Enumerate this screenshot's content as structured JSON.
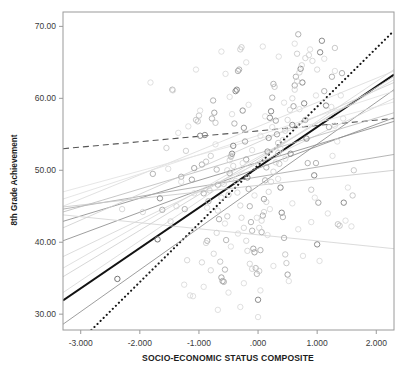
{
  "chart_data": {
    "type": "scatter",
    "title": "",
    "xlabel": "SOCIO-ECONOMIC STATUS COMPOSITE",
    "ylabel": "8th Grade Achievement",
    "xlim": [
      -3.3,
      2.3
    ],
    "ylim": [
      27.8,
      72.0
    ],
    "grid": false,
    "legend": "none",
    "x_ticks": [
      -3.0,
      -2.0,
      -1.0,
      0.0,
      1.0,
      2.0
    ],
    "x_tick_labels": [
      "-3.000",
      "-2.000",
      "-1.000",
      ".000",
      "1.000",
      "2.000"
    ],
    "y_ticks": [
      30.0,
      40.0,
      50.0,
      60.0,
      70.0
    ],
    "y_tick_labels": [
      "30.00",
      "40.00",
      "50.00",
      "60.00",
      "70.00"
    ],
    "marker": "open-circle",
    "marker_size": 5.4,
    "points": [
      [
        -2.38,
        34.9,
        0.55
      ],
      [
        -1.7,
        40.4,
        0.55
      ],
      [
        -1.66,
        46.1,
        0.42
      ],
      [
        -1.78,
        49.5,
        0.3
      ],
      [
        -1.62,
        44.5,
        0.3
      ],
      [
        -1.45,
        61.2,
        0.3
      ],
      [
        -1.55,
        53.1,
        0.22
      ],
      [
        -1.3,
        49.1,
        0.3
      ],
      [
        -1.24,
        44.6,
        0.3
      ],
      [
        -1.22,
        52.7,
        0.22
      ],
      [
        -1.12,
        48.7,
        0.35
      ],
      [
        -1.08,
        50.3,
        0.35
      ],
      [
        -1.05,
        57.0,
        0.25
      ],
      [
        -1.02,
        56.8,
        0.25
      ],
      [
        -1.0,
        57.6,
        0.25
      ],
      [
        -0.98,
        54.8,
        0.45
      ],
      [
        -0.95,
        50.8,
        0.3
      ],
      [
        -0.92,
        46.8,
        0.3
      ],
      [
        -0.9,
        54.9,
        0.45
      ],
      [
        -0.88,
        51.2,
        0.25
      ],
      [
        -0.86,
        40.2,
        0.3
      ],
      [
        -0.84,
        45.7,
        0.3
      ],
      [
        -0.82,
        47.2,
        0.22
      ],
      [
        -0.8,
        52.0,
        0.22
      ],
      [
        -0.78,
        57.2,
        0.3
      ],
      [
        -0.76,
        59.7,
        0.3
      ],
      [
        -0.74,
        58.0,
        0.35
      ],
      [
        -0.72,
        56.6,
        0.25
      ],
      [
        -0.7,
        50.1,
        0.28
      ],
      [
        -0.68,
        48.0,
        0.28
      ],
      [
        -0.66,
        43.2,
        0.3
      ],
      [
        -0.64,
        37.3,
        0.25
      ],
      [
        -0.62,
        35.1,
        0.35
      ],
      [
        -0.6,
        34.6,
        0.35
      ],
      [
        -0.58,
        34.5,
        0.3
      ],
      [
        -0.56,
        36.2,
        0.28
      ],
      [
        -0.54,
        40.3,
        0.28
      ],
      [
        -0.52,
        43.6,
        0.25
      ],
      [
        -0.5,
        46.6,
        0.25
      ],
      [
        -0.48,
        49.6,
        0.3
      ],
      [
        -0.46,
        51.9,
        0.3
      ],
      [
        -0.44,
        52.3,
        0.45
      ],
      [
        -0.42,
        53.4,
        0.45
      ],
      [
        -0.4,
        56.5,
        0.3
      ],
      [
        -0.38,
        61.0,
        0.45
      ],
      [
        -0.36,
        61.2,
        0.45
      ],
      [
        -0.34,
        63.8,
        0.3
      ],
      [
        -0.32,
        64.0,
        0.3
      ],
      [
        -0.3,
        66.8,
        0.22
      ],
      [
        -0.28,
        67.1,
        0.22
      ],
      [
        -0.26,
        58.3,
        0.4
      ],
      [
        -0.24,
        55.9,
        0.4
      ],
      [
        -0.22,
        54.0,
        0.35
      ],
      [
        -0.2,
        51.5,
        0.35
      ],
      [
        -0.18,
        49.0,
        0.45
      ],
      [
        -0.16,
        47.4,
        0.3
      ],
      [
        -0.14,
        45.0,
        0.3
      ],
      [
        -0.12,
        42.8,
        0.28
      ],
      [
        -0.1,
        41.6,
        0.28
      ],
      [
        -0.08,
        39.1,
        0.35
      ],
      [
        -0.06,
        38.6,
        0.35
      ],
      [
        -0.04,
        36.4,
        0.28
      ],
      [
        -0.02,
        35.6,
        0.28
      ],
      [
        0.0,
        32.0,
        0.45
      ],
      [
        0.02,
        36.0,
        0.22
      ],
      [
        0.04,
        38.9,
        0.3
      ],
      [
        0.06,
        41.4,
        0.3
      ],
      [
        0.08,
        43.7,
        0.35
      ],
      [
        0.1,
        46.0,
        0.35
      ],
      [
        0.12,
        48.6,
        0.3
      ],
      [
        0.14,
        50.4,
        0.3
      ],
      [
        0.16,
        52.6,
        0.4
      ],
      [
        0.18,
        54.5,
        0.4
      ],
      [
        0.2,
        57.3,
        0.45
      ],
      [
        0.22,
        58.2,
        0.45
      ],
      [
        0.24,
        60.1,
        0.3
      ],
      [
        0.26,
        62.0,
        0.3
      ],
      [
        0.28,
        61.6,
        0.25
      ],
      [
        0.3,
        56.9,
        0.35
      ],
      [
        0.32,
        55.0,
        0.35
      ],
      [
        0.34,
        53.8,
        0.25
      ],
      [
        0.36,
        50.9,
        0.25
      ],
      [
        0.38,
        47.6,
        0.45
      ],
      [
        0.4,
        44.1,
        0.45
      ],
      [
        0.42,
        43.5,
        0.3
      ],
      [
        0.44,
        40.6,
        0.3
      ],
      [
        0.46,
        38.3,
        0.25
      ],
      [
        0.48,
        37.1,
        0.25
      ],
      [
        0.5,
        35.5,
        0.35
      ],
      [
        0.55,
        52.3,
        0.45
      ],
      [
        0.58,
        56.3,
        0.45
      ],
      [
        0.6,
        58.9,
        0.35
      ],
      [
        0.62,
        61.8,
        0.35
      ],
      [
        0.64,
        63.0,
        0.3
      ],
      [
        0.66,
        66.2,
        0.22
      ],
      [
        0.68,
        68.9,
        0.3
      ],
      [
        0.72,
        64.1,
        0.45
      ],
      [
        0.75,
        62.2,
        0.45
      ],
      [
        0.78,
        59.3,
        0.45
      ],
      [
        0.8,
        57.0,
        0.3
      ],
      [
        0.82,
        54.4,
        0.45
      ],
      [
        0.84,
        51.0,
        0.3
      ],
      [
        0.9,
        47.3,
        0.25
      ],
      [
        0.95,
        49.3,
        0.45
      ],
      [
        0.98,
        51.0,
        0.3
      ],
      [
        1.0,
        39.7,
        0.45
      ],
      [
        1.02,
        45.5,
        0.35
      ],
      [
        1.05,
        66.4,
        0.45
      ],
      [
        1.08,
        68.0,
        0.45
      ],
      [
        1.12,
        61.0,
        0.3
      ],
      [
        1.15,
        59.0,
        0.45
      ],
      [
        1.2,
        56.0,
        0.3
      ],
      [
        1.25,
        63.0,
        0.3
      ],
      [
        1.3,
        67.0,
        0.25
      ],
      [
        1.35,
        42.5,
        0.25
      ],
      [
        1.38,
        42.3,
        0.25
      ],
      [
        1.42,
        63.5,
        0.3
      ],
      [
        1.45,
        45.5,
        0.45
      ],
      [
        1.6,
        46.5,
        0.25
      ],
      [
        1.62,
        50.0,
        0.25
      ],
      [
        -2.3,
        44.6,
        0.18
      ],
      [
        -1.95,
        44.2,
        0.18
      ],
      [
        -1.48,
        42.9,
        0.18
      ],
      [
        -1.38,
        45.0,
        0.18
      ],
      [
        -1.2,
        37.5,
        0.18
      ],
      [
        -1.15,
        32.6,
        0.15
      ],
      [
        -1.1,
        32.5,
        0.15
      ],
      [
        -0.95,
        37.2,
        0.18
      ],
      [
        -0.88,
        39.9,
        0.18
      ],
      [
        -0.8,
        36.1,
        0.18
      ],
      [
        -0.75,
        38.4,
        0.18
      ],
      [
        -0.7,
        41.3,
        0.18
      ],
      [
        -0.68,
        44.4,
        0.18
      ],
      [
        -0.62,
        46.2,
        0.18
      ],
      [
        -0.58,
        48.1,
        0.18
      ],
      [
        -0.52,
        50.0,
        0.18
      ],
      [
        -0.48,
        51.4,
        0.18
      ],
      [
        -0.45,
        52.0,
        0.18
      ],
      [
        -0.42,
        50.6,
        0.18
      ],
      [
        -0.38,
        48.5,
        0.18
      ],
      [
        -0.35,
        46.9,
        0.18
      ],
      [
        -0.3,
        45.1,
        0.18
      ],
      [
        -0.28,
        43.4,
        0.18
      ],
      [
        -0.24,
        42.0,
        0.18
      ],
      [
        -0.2,
        40.2,
        0.18
      ],
      [
        -0.18,
        38.8,
        0.18
      ],
      [
        -0.14,
        37.0,
        0.18
      ],
      [
        -0.1,
        36.3,
        0.18
      ],
      [
        0.02,
        42.0,
        0.18
      ],
      [
        0.06,
        43.0,
        0.18
      ],
      [
        0.1,
        44.2,
        0.18
      ],
      [
        0.14,
        45.6,
        0.18
      ],
      [
        0.18,
        47.0,
        0.18
      ],
      [
        0.22,
        48.4,
        0.18
      ],
      [
        0.26,
        49.8,
        0.18
      ],
      [
        0.3,
        51.1,
        0.18
      ],
      [
        0.34,
        52.4,
        0.18
      ],
      [
        0.38,
        53.0,
        0.18
      ],
      [
        0.42,
        54.2,
        0.18
      ],
      [
        0.46,
        55.5,
        0.18
      ],
      [
        0.5,
        57.0,
        0.18
      ],
      [
        0.54,
        58.4,
        0.18
      ],
      [
        0.58,
        60.0,
        0.18
      ],
      [
        0.62,
        61.2,
        0.18
      ],
      [
        0.66,
        62.4,
        0.18
      ],
      [
        0.7,
        63.6,
        0.18
      ],
      [
        0.74,
        64.6,
        0.18
      ],
      [
        0.8,
        65.6,
        0.18
      ],
      [
        0.86,
        66.0,
        0.18
      ],
      [
        0.92,
        65.2,
        0.18
      ],
      [
        1.0,
        64.0,
        0.18
      ],
      [
        -1.82,
        62.2,
        0.15
      ],
      [
        -1.44,
        61.1,
        0.15
      ],
      [
        -1.05,
        64.0,
        0.15
      ],
      [
        -0.62,
        66.5,
        0.15
      ],
      [
        -0.55,
        63.4,
        0.15
      ],
      [
        -0.48,
        60.2,
        0.15
      ],
      [
        -0.2,
        65.0,
        0.15
      ],
      [
        0.08,
        67.2,
        0.15
      ],
      [
        0.35,
        65.8,
        0.15
      ],
      [
        0.62,
        67.6,
        0.15
      ],
      [
        0.88,
        66.8,
        0.15
      ],
      [
        1.12,
        65.5,
        0.15
      ],
      [
        1.3,
        63.8,
        0.15
      ],
      [
        -1.35,
        55.2,
        0.15
      ],
      [
        -1.18,
        56.1,
        0.15
      ],
      [
        -0.98,
        58.3,
        0.15
      ],
      [
        -0.72,
        53.6,
        0.15
      ],
      [
        -0.44,
        57.8,
        0.15
      ],
      [
        -0.16,
        59.1,
        0.15
      ],
      [
        0.12,
        57.5,
        0.15
      ],
      [
        0.44,
        59.4,
        0.15
      ],
      [
        0.7,
        58.5,
        0.15
      ],
      [
        0.98,
        60.4,
        0.15
      ],
      [
        1.24,
        58.8,
        0.15
      ],
      [
        -1.25,
        34.1,
        0.15
      ],
      [
        -0.92,
        33.8,
        0.15
      ],
      [
        -0.5,
        33.0,
        0.15
      ],
      [
        -0.24,
        34.3,
        0.15
      ],
      [
        0.04,
        33.3,
        0.15
      ],
      [
        0.26,
        36.7,
        0.15
      ],
      [
        0.52,
        34.6,
        0.15
      ],
      [
        0.76,
        38.1,
        0.15
      ],
      [
        1.04,
        37.4,
        0.15
      ],
      [
        -0.3,
        31.0,
        0.15
      ],
      [
        0.0,
        29.6,
        0.15
      ],
      [
        -0.68,
        30.6,
        0.15
      ],
      [
        1.48,
        43.0,
        0.15
      ],
      [
        1.52,
        47.6,
        0.15
      ],
      [
        1.18,
        44.0,
        0.15
      ],
      [
        1.26,
        52.0,
        0.15
      ],
      [
        1.34,
        54.0,
        0.15
      ],
      [
        1.44,
        57.2,
        0.15
      ],
      [
        1.4,
        60.4,
        0.15
      ],
      [
        1.3,
        56.2,
        0.15
      ],
      [
        0.9,
        42.8,
        0.15
      ],
      [
        0.96,
        46.2,
        0.15
      ],
      [
        0.68,
        41.8,
        0.15
      ],
      [
        0.58,
        45.4,
        0.15
      ],
      [
        -0.06,
        46.5,
        0.15
      ],
      [
        0.16,
        41.0,
        0.15
      ],
      [
        -0.46,
        39.4,
        0.15
      ],
      [
        -0.34,
        41.2,
        0.15
      ],
      [
        -0.56,
        42.6,
        0.15
      ],
      [
        -0.86,
        44.8,
        0.15
      ],
      [
        -1.08,
        46.8,
        0.15
      ],
      [
        -1.3,
        48.4,
        0.15
      ],
      [
        -1.52,
        50.2,
        0.15
      ],
      [
        0.04,
        54.8,
        0.15
      ],
      [
        0.24,
        56.0,
        0.15
      ],
      [
        -0.1,
        52.8,
        0.15
      ],
      [
        -0.26,
        51.0,
        0.15
      ],
      [
        0.46,
        51.6,
        0.15
      ],
      [
        0.34,
        48.8,
        0.15
      ],
      [
        0.2,
        44.6,
        0.15
      ],
      [
        -0.02,
        43.4,
        0.15
      ],
      [
        1.58,
        42.2,
        0.15
      ]
    ],
    "lines": [
      {
        "name": "overall-regression",
        "style": "solid-thick",
        "color": "#121212",
        "width": 2.1,
        "x1": -3.3,
        "y1": 31.9,
        "x2": 2.3,
        "y2": 63.3
      },
      {
        "name": "dotted-regression",
        "style": "dotted",
        "color": "#1a1a1a",
        "width": 2.1,
        "x1": -2.82,
        "y1": 27.8,
        "x2": 2.3,
        "y2": 69.4
      },
      {
        "name": "dashed-flat-regression",
        "style": "dashed",
        "color": "#555555",
        "width": 1.1,
        "x1": -3.3,
        "y1": 53.0,
        "x2": 2.3,
        "y2": 57.2
      },
      {
        "name": "group-line-1",
        "style": "solid-thin",
        "color": "#8d8d8d",
        "width": 0.85,
        "x1": -3.3,
        "y1": 28.6,
        "x2": 2.3,
        "y2": 61.2
      },
      {
        "name": "group-line-2",
        "style": "solid-thin",
        "color": "#8d8d8d",
        "width": 0.85,
        "x1": -3.3,
        "y1": 40.2,
        "x2": 2.3,
        "y2": 57.3
      },
      {
        "name": "group-line-3",
        "style": "solid-thin",
        "color": "#8d8d8d",
        "width": 0.85,
        "x1": -3.3,
        "y1": 42.9,
        "x2": 2.3,
        "y2": 56.8
      },
      {
        "name": "group-line-4",
        "style": "solid-thin",
        "color": "#a8a8a8",
        "width": 0.85,
        "x1": -3.3,
        "y1": 44.6,
        "x2": 2.3,
        "y2": 52.2
      },
      {
        "name": "group-line-5",
        "style": "solid-thin",
        "color": "#c9c9c9",
        "width": 0.85,
        "x1": -3.3,
        "y1": 44.9,
        "x2": 2.3,
        "y2": 50.0
      },
      {
        "name": "group-line-6",
        "style": "solid-thin",
        "color": "#d4d4d4",
        "width": 0.85,
        "x1": -3.3,
        "y1": 43.8,
        "x2": 2.3,
        "y2": 39.1
      },
      {
        "name": "group-line-7",
        "style": "solid-thin",
        "color": "#cfcfcf",
        "width": 0.85,
        "x1": -3.3,
        "y1": 35.2,
        "x2": 2.3,
        "y2": 63.0
      },
      {
        "name": "group-line-8",
        "style": "solid-thin",
        "color": "#d8d8d8",
        "width": 0.85,
        "x1": -3.3,
        "y1": 33.0,
        "x2": 2.3,
        "y2": 64.0
      },
      {
        "name": "group-line-9",
        "style": "solid-thin",
        "color": "#dcdcdc",
        "width": 0.85,
        "x1": -3.3,
        "y1": 45.0,
        "x2": 2.3,
        "y2": 63.8
      },
      {
        "name": "group-line-10",
        "style": "solid-thin",
        "color": "#d0d0d0",
        "width": 0.85,
        "x1": -3.3,
        "y1": 42.0,
        "x2": 2.3,
        "y2": 62.2
      },
      {
        "name": "group-line-11",
        "style": "solid-thin",
        "color": "#e0e0e0",
        "width": 0.85,
        "x1": -3.3,
        "y1": 46.0,
        "x2": 2.3,
        "y2": 61.0
      },
      {
        "name": "group-line-12",
        "style": "solid-thin",
        "color": "#d6d6d6",
        "width": 0.85,
        "x1": -3.3,
        "y1": 38.0,
        "x2": 2.3,
        "y2": 60.0
      },
      {
        "name": "group-line-13",
        "style": "solid-thin",
        "color": "#bdbdbd",
        "width": 0.85,
        "x1": -3.3,
        "y1": 44.2,
        "x2": 2.3,
        "y2": 58.0
      },
      {
        "name": "group-line-14",
        "style": "solid-thin",
        "color": "#e2e2e2",
        "width": 0.85,
        "x1": -3.3,
        "y1": 47.0,
        "x2": 2.3,
        "y2": 59.5
      },
      {
        "name": "group-line-15",
        "style": "solid-thin",
        "color": "#dadada",
        "width": 0.85,
        "x1": -3.3,
        "y1": 36.4,
        "x2": 2.3,
        "y2": 62.6
      }
    ]
  },
  "axes": {
    "x_title": "SOCIO-ECONOMIC STATUS COMPOSITE",
    "y_title": "8th Grade Achievement"
  },
  "colors": {
    "frame": "#9a9a9a",
    "tick_text": "#3a3a3a",
    "axis_title": "#1c1c1c",
    "background": "#ffffff"
  }
}
